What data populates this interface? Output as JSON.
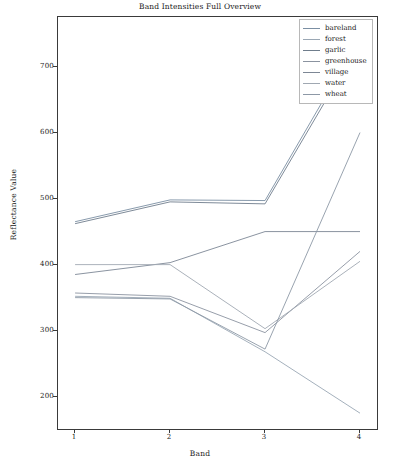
{
  "chart_data": {
    "type": "line",
    "title": "Band Intensities Full Overview",
    "xlabel": "Band",
    "ylabel": "Reflectance Value",
    "x": [
      1,
      2,
      3,
      4
    ],
    "xtick_labels": [
      "1",
      "2",
      "3",
      "4"
    ],
    "ytick_labels": [
      "200",
      "300",
      "400",
      "500",
      "600",
      "700"
    ],
    "yticks": [
      200,
      300,
      400,
      500,
      600,
      700
    ],
    "xlim": [
      0.82,
      4.2
    ],
    "ylim": [
      148,
      775
    ],
    "grid": false,
    "legend_position": "top-right",
    "series": [
      {
        "name": "bareland",
        "color": "#7b8fa3",
        "values": [
          465,
          498,
          497,
          745
        ]
      },
      {
        "name": "forest",
        "color": "#9aa7b4",
        "values": [
          352,
          349,
          268,
          175
        ]
      },
      {
        "name": "garlic",
        "color": "#6f7d8c",
        "values": [
          462,
          495,
          492,
          737
        ]
      },
      {
        "name": "greenhouse",
        "color": "#8b93a0",
        "values": [
          357,
          352,
          297,
          420
        ]
      },
      {
        "name": "village",
        "color": "#7d8795",
        "values": [
          385,
          403,
          450,
          450
        ]
      },
      {
        "name": "water",
        "color": "#a0a8b2",
        "values": [
          400,
          400,
          303,
          405
        ]
      },
      {
        "name": "wheat",
        "color": "#8d98a6",
        "values": [
          350,
          348,
          272,
          600
        ]
      }
    ]
  }
}
